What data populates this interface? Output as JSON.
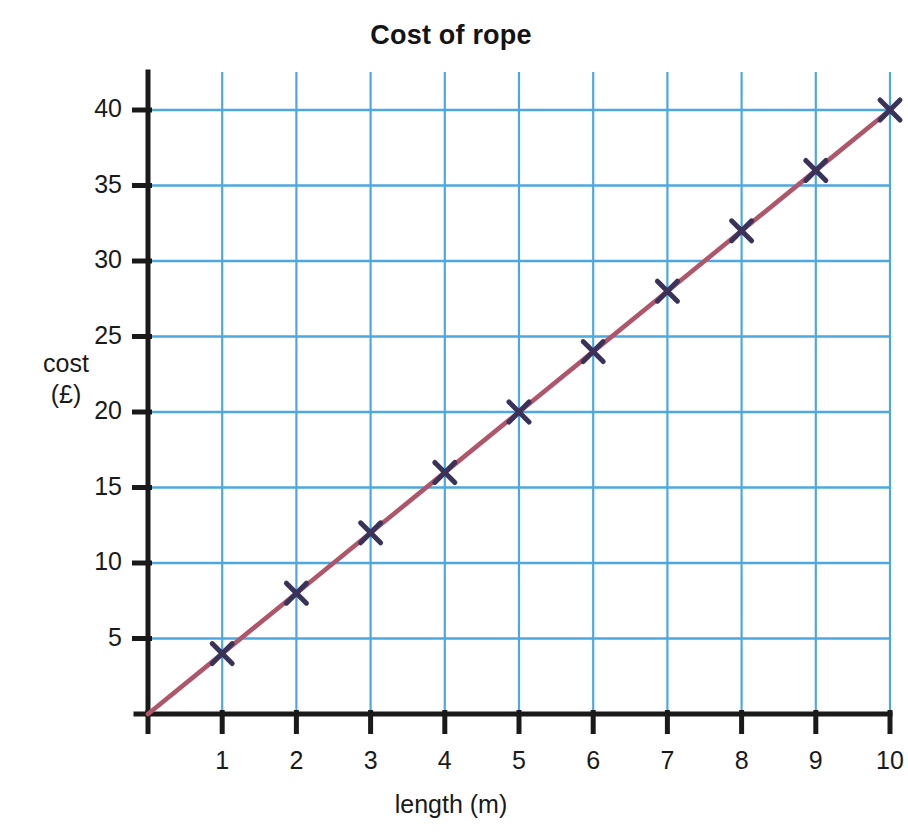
{
  "chart_data": {
    "type": "line",
    "title": "Cost of rope",
    "xlabel": "length (m)",
    "ylabel_lines": [
      "cost",
      "(£)"
    ],
    "x": [
      1,
      2,
      3,
      4,
      5,
      6,
      7,
      8,
      9,
      10
    ],
    "values": [
      4,
      8,
      12,
      16,
      20,
      24,
      28,
      32,
      36,
      40
    ],
    "series": [
      {
        "name": "cost of rope",
        "values": [
          4,
          8,
          12,
          16,
          20,
          24,
          28,
          32,
          36,
          40
        ]
      }
    ],
    "x_tick_labels": [
      "1",
      "2",
      "3",
      "4",
      "5",
      "6",
      "7",
      "8",
      "9",
      "10"
    ],
    "y_tick_labels": [
      "5",
      "10",
      "15",
      "20",
      "25",
      "30",
      "35",
      "40"
    ],
    "y_ticks": [
      5,
      10,
      15,
      20,
      25,
      30,
      35,
      40
    ],
    "xlim": [
      0,
      10
    ],
    "ylim": [
      0,
      40
    ],
    "grid": true,
    "legend": "none",
    "marker": "x-cross",
    "line_color": "#b0566a",
    "marker_color": "#3a3258",
    "grid_color": "#4ea8e0",
    "axis_color": "#1a1a1a",
    "background_color": "#ffffff",
    "line_through_origin": true
  }
}
